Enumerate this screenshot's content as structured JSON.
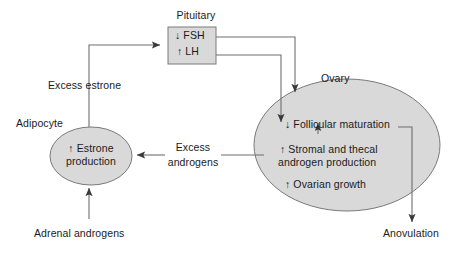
{
  "diagram": {
    "type": "flow-diagram",
    "title_visible": false,
    "colors": {
      "shape_fill": "#d9d9d9",
      "shape_stroke": "#7a7a7a",
      "edge_stroke": "#6e6e6e",
      "text": "#1a1a1a",
      "background": "#ffffff"
    },
    "nodes": {
      "pituitary": {
        "caption": "Pituitary",
        "shape": "rectangle",
        "lines": [
          "↓ FSH",
          "↑ LH"
        ]
      },
      "adipocyte": {
        "caption": "Adipocyte",
        "shape": "ellipse",
        "lines": [
          "↑ Estrone",
          "production"
        ]
      },
      "ovary": {
        "caption": "Ovary",
        "shape": "ellipse",
        "lines": [
          "↓ Follicular maturation",
          "↑ Stromal and thecal",
          "androgen production",
          "↑ Ovarian growth"
        ],
        "line_groups": {
          "follicular": "↓ Follicular maturation",
          "stromal_thecal_1": "↑ Stromal and thecal",
          "stromal_thecal_2": "androgen production",
          "ovarian_growth": "↑ Ovarian growth"
        }
      }
    },
    "edge_labels": {
      "excess_estrone": "Excess estrone",
      "excess_androgens_line1": "Excess",
      "excess_androgens_line2": "androgens"
    },
    "terminals": {
      "adrenal_androgens": "Adrenal androgens",
      "anovulation": "Anovulation"
    },
    "arrow_semantics": {
      "adrenal_to_adipocyte": "Adrenal androgens increase estrone production in adipocyte",
      "adipocyte_to_pituitary": "Excess estrone acts on pituitary",
      "pituitary_fsh_to_ovary": "Decreased FSH reduces follicular maturation",
      "pituitary_lh_to_ovary": "Increased LH raises stromal and thecal androgen production",
      "ovary_to_adipocyte": "Excess androgens feed adipocyte estrone production",
      "ovary_internal_feedback": "Stromal/thecal androgens impair follicular maturation",
      "ovary_to_anovulation": "Decreased follicular maturation leads to anovulation"
    }
  }
}
